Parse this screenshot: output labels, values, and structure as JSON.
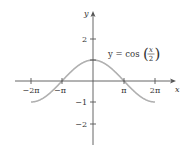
{
  "chart_data": {
    "type": "line",
    "title": "",
    "equation_label": {
      "lhs": "y = cos",
      "numerator": "x",
      "denominator": "2"
    },
    "xlabel": "x",
    "ylabel": "y",
    "x_ticks": [
      "−2π",
      "−π",
      "π",
      "2π"
    ],
    "y_ticks": [
      "2",
      "−1",
      "−2"
    ],
    "xlim": [
      "−2π",
      "2π"
    ],
    "ylim": [
      -2,
      2
    ],
    "grid": false,
    "series": [
      {
        "name": "y = cos(x/2)",
        "color": "#b0b0b0",
        "x": [
          "−2π",
          "−π",
          "0",
          "π",
          "2π"
        ],
        "values": [
          -1,
          0,
          1,
          0,
          -1
        ]
      }
    ]
  },
  "colors": {
    "axis": "#555555",
    "curve": "#b0b0b0",
    "text": "#333333"
  }
}
